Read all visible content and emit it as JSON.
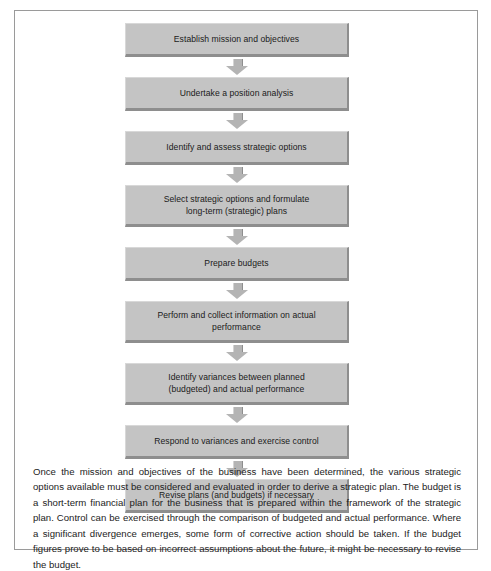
{
  "figure": {
    "flowchart": {
      "steps": [
        {
          "lines": [
            "Establish mission and objectives"
          ]
        },
        {
          "lines": [
            "Undertake a position analysis"
          ]
        },
        {
          "lines": [
            "Identify and assess strategic options"
          ]
        },
        {
          "lines": [
            "Select strategic options and formulate",
            "long-term (strategic) plans"
          ]
        },
        {
          "lines": [
            "Prepare budgets"
          ]
        },
        {
          "lines": [
            "Perform and collect information on actual",
            "performance"
          ]
        },
        {
          "lines": [
            "Identify variances between planned",
            "(budgeted) and actual performance"
          ]
        },
        {
          "lines": [
            "Respond to variances and exercise control"
          ]
        },
        {
          "lines": [
            "Revise plans (and budgets) if necessary"
          ]
        }
      ],
      "arrow_icon": "down-block-arrow-icon",
      "box_fill_color": "#c4c4c4",
      "box_shadow_color": "#8e8e8e",
      "arrow_color": "#b4b4b4"
    },
    "caption": {
      "text": "Once the mission and objectives of the business have been determined, the various strategic options available must be considered and evaluated in order to derive a strategic plan. The budget is a short-term financial plan for the business that is prepared within the framework of the strategic plan. Control can be exercised through the comparison of budgeted and actual performance. Where a significant divergence emerges, some form of corrective action should be taken. If the budget figures prove to be based on incorrect assumptions about the future, it might be necessary to revise the budget."
    },
    "frame_border_color": "#9a9a9a",
    "background_color": "#ffffff"
  }
}
